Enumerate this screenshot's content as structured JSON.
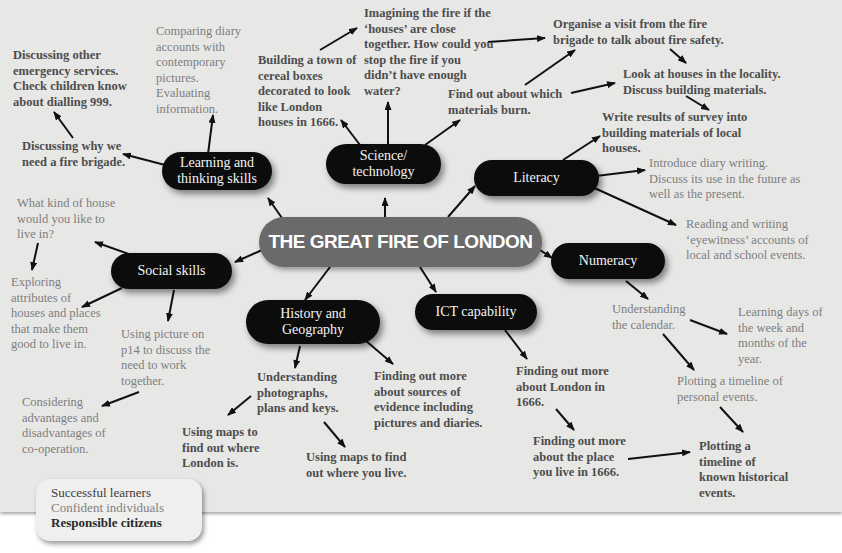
{
  "title": "THE GREAT FIRE OF LONDON",
  "colors": {
    "page_bg": "#e7e7e6",
    "node_bg": "#0c0c0c",
    "center_bg": "#6a6a6a",
    "dark_text": "#4d4d4d",
    "light_text": "#7e7e7e"
  },
  "nodes": {
    "learning": "Learning and thinking skills",
    "science": "Science/ technology",
    "literacy": "Literacy",
    "social": "Social skills",
    "numeracy": "Numeracy",
    "history": "History and Geography",
    "ict": "ICT capability"
  },
  "notes": {
    "emergency": "Discussing other emergency services. Check children know about dialling 999.",
    "brigade_need": "Discussing why we need a fire brigade.",
    "diary_compare": "Comparing diary accounts with contemporary pictures. Evaluating information.",
    "cereal_boxes": "Building a town of cereal boxes decorated to look like London houses in 1666.",
    "imagining": "Imagining the fire if the ‘houses’ are close together. How could you stop the fire if you didn’t have enough water?",
    "materials_burn": "Find out about which materials burn.",
    "organise_visit": "Organise a visit from the fire brigade to talk about fire safety.",
    "look_houses": "Look at houses in the locality. Discuss building materials.",
    "write_results": "Write results of survey into building materials of local houses.",
    "diary_writing": "Introduce diary writing. Discuss its use in the future as well as the present.",
    "eyewitness": "Reading and writing ‘eyewitness’ accounts of local and school events.",
    "kind_of_house": "What kind of house would you like to live in?",
    "exploring": "Exploring attributes of houses and places that make them good to live in.",
    "picture_p14": "Using picture on p14 to discuss the need to work together.",
    "cooperation": "Considering advantages and disadvantages of co-operation.",
    "understanding_photos": "Understanding photographs, plans and keys.",
    "maps_london": "Using maps to find out where London is.",
    "maps_live": "Using maps to find out where you live.",
    "sources": "Finding out more about sources of evidence including pictures and diaries.",
    "london_1666": "Finding out more about London in 1666.",
    "place_1666": "Finding out more about the place you live in 1666.",
    "calendar": "Understanding the calendar.",
    "days_week": "Learning days of the week and months of the year.",
    "timeline_personal": "Plotting a timeline of personal events.",
    "timeline_historical": "Plotting a timeline of known historical events."
  },
  "legend": {
    "line1": "Successful learners",
    "line2": "Confident individuals",
    "line3": "Responsible citizens"
  }
}
